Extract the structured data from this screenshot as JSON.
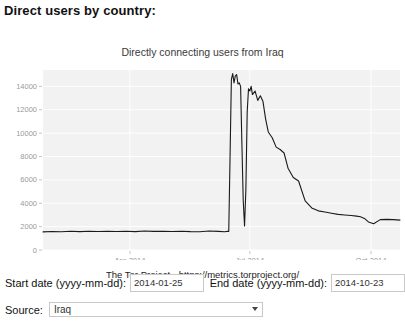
{
  "page": {
    "heading": "Direct users by country:"
  },
  "chart_data": {
    "type": "line",
    "title": "Directly connecting users from Iraq",
    "caption": "The Tor Project - https://metrics.torproject.org/",
    "xlabel": "",
    "ylabel": "",
    "grid": true,
    "legend": null,
    "line_color": "#1a1a1a",
    "plot_bg": "#f2f2f2",
    "ylim": [
      0,
      15400
    ],
    "yticks": [
      0,
      2000,
      4000,
      6000,
      8000,
      10000,
      12000,
      14000
    ],
    "ytick_labels": [
      "0",
      "2000",
      "4000",
      "6000",
      "8000",
      "10000",
      "12000",
      "14000"
    ],
    "xlim": [
      "2014-01-25",
      "2014-10-23"
    ],
    "xticks": [
      "2014-04-01",
      "2014-07-01",
      "2014-10-01"
    ],
    "xtick_labels": [
      "Apr-2014",
      "Jul-2014",
      "Oct-2014"
    ],
    "x": [
      "2014-01-25",
      "2014-02-01",
      "2014-02-08",
      "2014-02-15",
      "2014-02-22",
      "2014-03-01",
      "2014-03-08",
      "2014-03-15",
      "2014-03-22",
      "2014-03-29",
      "2014-04-05",
      "2014-04-12",
      "2014-04-19",
      "2014-04-26",
      "2014-05-03",
      "2014-05-10",
      "2014-05-17",
      "2014-05-24",
      "2014-05-31",
      "2014-06-07",
      "2014-06-12",
      "2014-06-14",
      "2014-06-15",
      "2014-06-16",
      "2014-06-17",
      "2014-06-18",
      "2014-06-19",
      "2014-06-20",
      "2014-06-21",
      "2014-06-22",
      "2014-06-23",
      "2014-06-24",
      "2014-06-25",
      "2014-06-26",
      "2014-06-27",
      "2014-06-28",
      "2014-06-29",
      "2014-06-30",
      "2014-07-01",
      "2014-07-02",
      "2014-07-03",
      "2014-07-05",
      "2014-07-07",
      "2014-07-09",
      "2014-07-11",
      "2014-07-13",
      "2014-07-15",
      "2014-07-18",
      "2014-07-21",
      "2014-07-24",
      "2014-07-27",
      "2014-07-30",
      "2014-08-03",
      "2014-08-07",
      "2014-08-12",
      "2014-08-17",
      "2014-08-22",
      "2014-08-27",
      "2014-09-01",
      "2014-09-06",
      "2014-09-11",
      "2014-09-16",
      "2014-09-20",
      "2014-09-23",
      "2014-09-26",
      "2014-09-29",
      "2014-10-03",
      "2014-10-08",
      "2014-10-13",
      "2014-10-18",
      "2014-10-23"
    ],
    "values": [
      1550,
      1580,
      1560,
      1600,
      1570,
      1600,
      1580,
      1610,
      1580,
      1600,
      1570,
      1620,
      1590,
      1610,
      1580,
      1600,
      1570,
      1560,
      1620,
      1590,
      1560,
      1600,
      1580,
      8000,
      14600,
      15100,
      14300,
      14900,
      15000,
      14200,
      14300,
      14000,
      9000,
      4200,
      2050,
      5200,
      11800,
      13800,
      13600,
      14000,
      13300,
      13600,
      12800,
      13200,
      12700,
      11200,
      10100,
      9600,
      8800,
      8600,
      8300,
      7000,
      6200,
      5900,
      4200,
      3600,
      3350,
      3250,
      3150,
      3050,
      3000,
      2950,
      2900,
      2850,
      2700,
      2400,
      2250,
      2600,
      2620,
      2600,
      2560
    ],
    "annotations": []
  },
  "form": {
    "start_date_label": "Start date (yyyy-mm-dd):",
    "start_date_value": "2014-01-25",
    "end_date_label": "End date (yyyy-mm-dd):",
    "end_date_value": "2014-10-23",
    "source_label": "Source:",
    "source_value": "Iraq",
    "source_options": [
      "Iraq"
    ]
  }
}
